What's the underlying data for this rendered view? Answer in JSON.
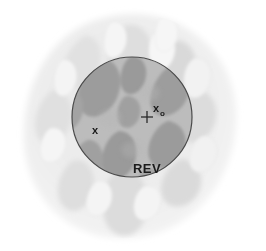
{
  "figure": {
    "width": 266,
    "height": 251,
    "background_color": "#ffffff"
  },
  "labels": {
    "point_x": "x",
    "point_x0_base": "x",
    "point_x0_sub": "o",
    "rev": "REV"
  },
  "colors": {
    "background": "#ffffff",
    "domain_fill": "#eeeeee",
    "domain_fill_inner": "#e6e6e6",
    "outer_grain": "#dcdcdc",
    "outer_pore": "#f4f4f4",
    "rev_overlay": "#bdbdbd",
    "rev_grain": "#9a9a9a",
    "rev_pore": "#b4b4b4",
    "circle_stroke": "#4a4a4a",
    "label_text": "#1a1a1a",
    "marker_stroke": "#2a2a2a"
  },
  "rev_circle": {
    "cx": 132,
    "cy": 117,
    "r": 60,
    "stroke_width": 1.2
  },
  "markers": {
    "x0_cross": {
      "cx": 147,
      "cy": 117,
      "arm": 6
    },
    "x_point": {
      "cx": 99,
      "cy": 130
    }
  },
  "label_positions": {
    "point_x": {
      "x": 95,
      "y": 134
    },
    "point_x0": {
      "x": 154,
      "y": 113
    },
    "point_x0_sub": {
      "x": 161,
      "y": 116
    },
    "rev": {
      "x": 147,
      "y": 172
    }
  }
}
